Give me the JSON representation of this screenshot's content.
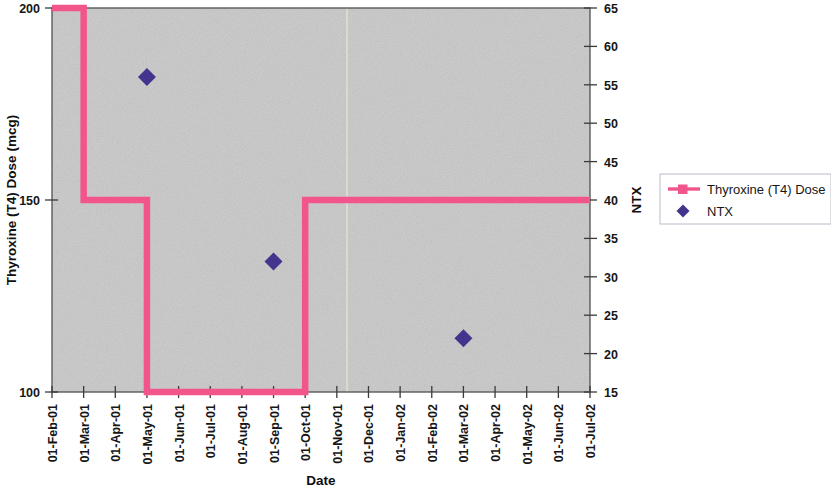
{
  "chart_data": {
    "type": "line",
    "title": "",
    "xlabel": "Date",
    "ylabel": "Thyroxine (T4) Dose (mcg)",
    "y2label": "NTX",
    "grid": false,
    "legend_position": "right",
    "x_tick_labels": [
      "01-Feb-01",
      "01-Mar-01",
      "01-Apr-01",
      "01-May-01",
      "01-Jun-01",
      "01-Jul-01",
      "01-Aug-01",
      "01-Sep-01",
      "01-Oct-01",
      "01-Nov-01",
      "01-Dec-01",
      "01-Jan-02",
      "01-Feb-02",
      "01-Mar-02",
      "01-Apr-02",
      "01-May-02",
      "01-Jun-02",
      "01-Jul-02"
    ],
    "y_tick_labels": [
      "100",
      "150",
      "200"
    ],
    "y_ticks": [
      100,
      150,
      200
    ],
    "ylim": [
      100,
      200
    ],
    "y2_tick_labels": [
      "15",
      "20",
      "25",
      "30",
      "35",
      "40",
      "45",
      "50",
      "55",
      "60",
      "65"
    ],
    "y2_ticks": [
      15,
      20,
      25,
      30,
      35,
      40,
      45,
      50,
      55,
      60,
      65
    ],
    "y2lim": [
      15,
      65
    ],
    "series": [
      {
        "name": "Thyroxine (T4) Dose",
        "type": "step",
        "axis": "left",
        "color": "#f2558c",
        "marker": "square",
        "points": [
          {
            "x": "01-Feb-01",
            "y": 200
          },
          {
            "x": "01-Mar-01",
            "y": 200
          },
          {
            "x": "01-Mar-01",
            "y": 150
          },
          {
            "x": "01-May-01",
            "y": 150
          },
          {
            "x": "01-May-01",
            "y": 100
          },
          {
            "x": "01-Oct-01",
            "y": 100
          },
          {
            "x": "01-Oct-01",
            "y": 150
          },
          {
            "x": "01-Jul-02",
            "y": 150
          }
        ]
      },
      {
        "name": "NTX",
        "type": "scatter",
        "axis": "right",
        "color": "#45348e",
        "marker": "diamond",
        "points": [
          {
            "x": "01-May-01",
            "y": 56
          },
          {
            "x": "01-Sep-01",
            "y": 32
          },
          {
            "x": "01-Mar-02",
            "y": 22
          }
        ]
      }
    ]
  },
  "legend": {
    "entries": [
      {
        "label": "Thyroxine (T4) Dose",
        "color": "#f2558c",
        "marker": "line-square"
      },
      {
        "label": "NTX",
        "color": "#45348e",
        "marker": "diamond"
      }
    ]
  },
  "colors": {
    "plot_background": "#c9c9c9",
    "series_thyroxine": "#f2558c",
    "series_ntx": "#45348e",
    "axis": "#444444"
  }
}
